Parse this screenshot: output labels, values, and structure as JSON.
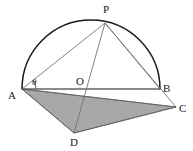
{
  "figure": {
    "width": 193,
    "height": 151,
    "background_color": "#ffffff"
  },
  "colors": {
    "stroke_dark": "#1a1a1a",
    "stroke_thin": "#6b6b6b",
    "shade_fill": "#a8a8a8",
    "shade_stroke": "#5a5a5a",
    "label_color": "#1a1a1a"
  },
  "points": {
    "A": {
      "label": "A",
      "x": 22,
      "y": 89,
      "label_x": 8,
      "label_y": 90
    },
    "B": {
      "label": "B",
      "x": 160,
      "y": 89,
      "label_x": 163,
      "label_y": 83
    },
    "C": {
      "label": "C",
      "x": 176,
      "y": 107,
      "label_x": 179,
      "label_y": 103
    },
    "D": {
      "label": "D",
      "x": 74,
      "y": 133,
      "label_x": 70,
      "label_y": 138
    },
    "O": {
      "label": "O",
      "x": 91,
      "y": 89,
      "label_x": 76,
      "label_y": 76
    },
    "P": {
      "label": "P",
      "x": 105,
      "y": 23,
      "label_x": 103,
      "label_y": 5
    }
  },
  "angle": {
    "symbol": "θ",
    "at_vertex": "A",
    "between": [
      "AP",
      "AB"
    ],
    "label_x": 32,
    "label_y": 79,
    "arc_radius": 14
  },
  "semicircle": {
    "center_x": 91,
    "center_y": 89,
    "radius": 69,
    "from": "A",
    "to": "B",
    "description": "upper semicircular arc on diameter AB"
  },
  "segments": [
    {
      "name": "diameter-AB",
      "from": "A",
      "to": "B",
      "weight": "medium"
    },
    {
      "name": "chord-AP",
      "from": "A",
      "to": "P",
      "weight": "thin"
    },
    {
      "name": "chord-PB",
      "from": "P",
      "to": "B",
      "weight": "thin"
    },
    {
      "name": "line-PD",
      "from": "P",
      "to": "D",
      "weight": "thin"
    },
    {
      "name": "line-PC",
      "from": "P",
      "to": "C",
      "weight": "thin"
    },
    {
      "name": "edge-AD",
      "from": "A",
      "to": "D",
      "weight": "thin"
    },
    {
      "name": "edge-DC",
      "from": "D",
      "to": "C",
      "weight": "thin"
    },
    {
      "name": "edge-AC",
      "from": "A",
      "to": "C",
      "weight": "thin"
    },
    {
      "name": "edge-BC",
      "from": "B",
      "to": "C",
      "weight": "thin"
    }
  ],
  "shaded_region": {
    "name": "triangle-ADC",
    "vertices": [
      "A",
      "D",
      "C"
    ],
    "fill": "#a8a8a8"
  }
}
